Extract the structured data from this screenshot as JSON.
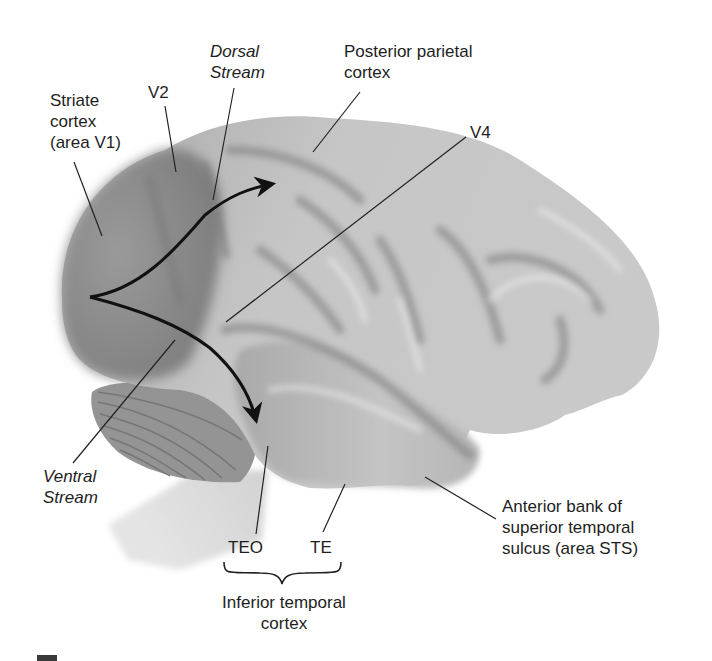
{
  "figure": {
    "background_color": "#ffffff",
    "brain_tone_colors": {
      "occipital": "#8a8a8a",
      "cortex_mid": "#b4b4b4",
      "cortex_light": "#d4d4d4",
      "highlight": "#eeeeee",
      "sulcus": "#6e6e6e",
      "cerebellum": "#9a9a9a",
      "brainstem": "#dcdcdc"
    },
    "arrow_color": "#111111",
    "leader_line_color": "#222222"
  },
  "labels": {
    "striate": {
      "lines": [
        "Striate",
        "cortex",
        "(area V1)"
      ]
    },
    "v2": {
      "text": "V2"
    },
    "dorsal_stream": {
      "lines": [
        "Dorsal",
        "Stream"
      ]
    },
    "posterior_parietal": {
      "lines": [
        "Posterior parietal",
        "cortex"
      ]
    },
    "v4": {
      "text": "V4"
    },
    "ventral_stream": {
      "lines": [
        "Ventral",
        "Stream"
      ]
    },
    "teo": {
      "text": "TEO"
    },
    "te": {
      "text": "TE"
    },
    "inferior_temporal": {
      "lines": [
        "Inferior temporal",
        "cortex"
      ]
    },
    "sts": {
      "lines": [
        "Anterior bank of",
        "superior temporal",
        "sulcus (area STS)"
      ]
    }
  },
  "streams": [
    {
      "name": "Dorsal Stream",
      "from": "Striate cortex (area V1)",
      "toward": "Posterior parietal cortex"
    },
    {
      "name": "Ventral Stream",
      "from": "Striate cortex (area V1)",
      "toward": "Inferior temporal cortex"
    }
  ]
}
